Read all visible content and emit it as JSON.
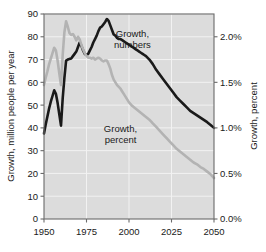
{
  "chart_data": {
    "type": "line",
    "title": "",
    "xlabel": "",
    "ylabel": "Growth, million people per year",
    "y2label": "Growth, percent",
    "xlim": [
      1950,
      2050
    ],
    "ylim": [
      0,
      90
    ],
    "y2lim": [
      0.0,
      2.25
    ],
    "grid": true,
    "legend_position": "inline-annotations",
    "plot_background": "#dcdcdc",
    "xticks": [
      1950,
      1975,
      2000,
      2025,
      2050
    ],
    "xtick_labels": [
      "1950",
      "1975",
      "2000",
      "2025",
      "2050"
    ],
    "yticks": [
      0,
      10,
      20,
      30,
      40,
      50,
      60,
      70,
      80,
      90
    ],
    "ytick_labels": [
      "0",
      "10",
      "20",
      "30",
      "40",
      "50",
      "60",
      "70",
      "80",
      "90"
    ],
    "y2ticks": [
      0.0,
      0.5,
      1.0,
      1.5,
      2.0
    ],
    "y2tick_labels": [
      "0.0%",
      "0.5%",
      "1.0%",
      "1.5%",
      "2.0%"
    ],
    "annotations": [
      {
        "text_line1": "Growth,",
        "text_line2": "numbers",
        "x": 2002,
        "y": 80,
        "color": "#1a1a1a"
      },
      {
        "text_line1": "Growth,",
        "text_line2": "percent",
        "x": 1995,
        "y": 38,
        "color": "#1a1a1a"
      }
    ],
    "series": [
      {
        "name": "Growth, numbers",
        "axis": "left",
        "units": "million people per year",
        "color": "#1a1a1a",
        "linewidth": 2.6,
        "x": [
          1950,
          1951,
          1952,
          1953,
          1954,
          1955,
          1956,
          1957,
          1958,
          1959,
          1960,
          1961,
          1962,
          1963,
          1964,
          1965,
          1966,
          1967,
          1968,
          1969,
          1970,
          1971,
          1972,
          1973,
          1974,
          1975,
          1976,
          1977,
          1978,
          1979,
          1980,
          1981,
          1982,
          1983,
          1984,
          1985,
          1986,
          1987,
          1988,
          1989,
          1990,
          1991,
          1992,
          1993,
          1994,
          1995,
          1996,
          1997,
          1998,
          1999,
          2000,
          2001,
          2002,
          2003,
          2004,
          2005,
          2006,
          2007,
          2008,
          2009,
          2010,
          2012,
          2014,
          2016,
          2018,
          2020,
          2022,
          2024,
          2026,
          2028,
          2030,
          2032,
          2034,
          2036,
          2038,
          2040,
          2042,
          2044,
          2046,
          2048,
          2050
        ],
        "values": [
          37.5,
          41.5,
          45.0,
          48.5,
          51.5,
          54.0,
          56.5,
          55.0,
          51.0,
          46.0,
          41.0,
          53.0,
          62.0,
          69.5,
          70.0,
          70.3,
          70.5,
          71.5,
          72.5,
          73.5,
          75.5,
          77.5,
          76.0,
          74.0,
          72.5,
          72.0,
          72.5,
          74.0,
          75.5,
          77.5,
          79.0,
          80.5,
          82.5,
          84.0,
          84.5,
          85.5,
          86.5,
          87.8,
          87.0,
          85.0,
          83.0,
          81.0,
          80.5,
          79.5,
          79.0,
          79.0,
          78.5,
          78.0,
          77.5,
          77.0,
          76.5,
          76.0,
          75.5,
          75.0,
          74.5,
          74.0,
          73.5,
          73.0,
          72.5,
          72.0,
          71.5,
          70.0,
          68.0,
          65.5,
          63.5,
          61.5,
          59.5,
          57.5,
          55.5,
          53.5,
          52.0,
          50.5,
          49.0,
          47.5,
          46.5,
          45.5,
          44.5,
          43.5,
          42.5,
          41.3,
          40.0
        ]
      },
      {
        "name": "Growth, percent",
        "axis": "right",
        "units": "percent",
        "color": "#b3b3b3",
        "linewidth": 2.6,
        "x": [
          1950,
          1951,
          1952,
          1953,
          1954,
          1955,
          1956,
          1957,
          1958,
          1959,
          1960,
          1961,
          1962,
          1963,
          1964,
          1965,
          1966,
          1967,
          1968,
          1969,
          1970,
          1971,
          1972,
          1973,
          1974,
          1975,
          1976,
          1977,
          1978,
          1979,
          1980,
          1981,
          1982,
          1983,
          1984,
          1985,
          1986,
          1987,
          1988,
          1989,
          1990,
          1991,
          1992,
          1993,
          1994,
          1995,
          1996,
          1997,
          1998,
          1999,
          2000,
          2002,
          2004,
          2006,
          2008,
          2010,
          2012,
          2014,
          2016,
          2018,
          2020,
          2022,
          2024,
          2026,
          2028,
          2030,
          2032,
          2034,
          2036,
          2038,
          2040,
          2042,
          2044,
          2046,
          2048,
          2050
        ],
        "values": [
          1.47,
          1.55,
          1.62,
          1.7,
          1.76,
          1.82,
          1.88,
          1.85,
          1.74,
          1.6,
          1.47,
          1.8,
          2.05,
          2.17,
          2.11,
          2.04,
          2.02,
          2.03,
          2.0,
          1.96,
          2.0,
          1.97,
          1.91,
          1.86,
          1.82,
          1.79,
          1.77,
          1.77,
          1.76,
          1.77,
          1.75,
          1.76,
          1.77,
          1.76,
          1.74,
          1.73,
          1.74,
          1.74,
          1.7,
          1.65,
          1.58,
          1.53,
          1.5,
          1.47,
          1.45,
          1.43,
          1.4,
          1.37,
          1.34,
          1.31,
          1.28,
          1.24,
          1.21,
          1.18,
          1.15,
          1.12,
          1.09,
          1.05,
          1.01,
          0.97,
          0.93,
          0.89,
          0.85,
          0.81,
          0.77,
          0.74,
          0.71,
          0.68,
          0.65,
          0.62,
          0.6,
          0.57,
          0.55,
          0.52,
          0.49,
          0.45
        ]
      }
    ]
  },
  "axes": {
    "left_title": "Growth, million people per year",
    "right_title": "Growth, percent"
  }
}
